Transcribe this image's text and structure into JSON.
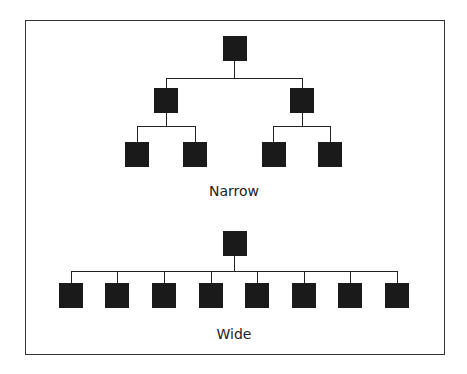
{
  "diagrams": [
    {
      "label": "Narrow",
      "structure": "root -> 2 children -> 4 grandchildren (2 each)"
    },
    {
      "label": "Wide",
      "structure": "root -> 8 children"
    }
  ],
  "colors": {
    "node": "#1a1a1a",
    "line": "#222222",
    "border": "#333333",
    "background": "#ffffff"
  }
}
